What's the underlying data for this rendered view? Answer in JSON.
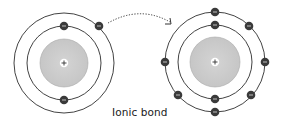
{
  "diagram": {
    "caption": "Ionic bond",
    "colors": {
      "ring": "#2e2e2e",
      "nucleus_fill": "#cfcfcf",
      "nucleus_stroke": "#9a9a9a",
      "electron": "#3a3a3a",
      "electron_sign": "#e8e8e8",
      "arrow": "#333333"
    },
    "atoms": [
      {
        "id": "donor-atom",
        "center": [
          64,
          63
        ],
        "nucleus_radius": 24,
        "nucleus_label": "+",
        "shells": [
          37,
          50
        ],
        "electrons": [
          {
            "shell": 0,
            "pos": [
              64,
              26
            ],
            "label": "−"
          },
          {
            "shell": 0,
            "pos": [
              64,
              100
            ],
            "label": "−"
          },
          {
            "shell": 1,
            "pos": [
              99,
              26
            ],
            "label": "−"
          }
        ]
      },
      {
        "id": "acceptor-atom",
        "center": [
          215,
          62
        ],
        "nucleus_radius": 25,
        "nucleus_label": "+",
        "shells": [
          37,
          50
        ],
        "electrons": [
          {
            "shell": 0,
            "pos": [
              215,
              25
            ],
            "label": "−"
          },
          {
            "shell": 0,
            "pos": [
              215,
              99
            ],
            "label": "−"
          },
          {
            "shell": 1,
            "pos": [
              215,
              12
            ],
            "label": "−"
          },
          {
            "shell": 1,
            "pos": [
              249,
              26
            ],
            "label": "−"
          },
          {
            "shell": 1,
            "pos": [
              265,
              62
            ],
            "label": "−"
          },
          {
            "shell": 1,
            "pos": [
              251,
              95
            ],
            "label": "−"
          },
          {
            "shell": 1,
            "pos": [
              215,
              112
            ],
            "label": "−"
          },
          {
            "shell": 1,
            "pos": [
              178,
              95
            ],
            "label": "−"
          },
          {
            "shell": 1,
            "pos": [
              165,
              62
            ],
            "label": "−"
          }
        ]
      }
    ],
    "transfer_arrow": {
      "from": [
        108,
        22
      ],
      "to": [
        170,
        22
      ],
      "style": "dotted"
    }
  }
}
